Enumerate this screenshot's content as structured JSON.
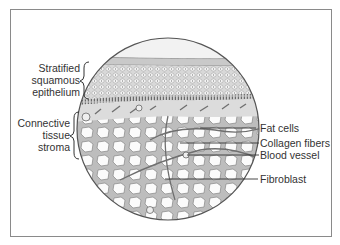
{
  "diagram": {
    "type": "histology-illustration",
    "left_labels": [
      {
        "lines": [
          "Stratified",
          "squamous",
          "epithelium"
        ]
      },
      {
        "lines": [
          "Connective",
          "tissue",
          "stroma"
        ]
      }
    ],
    "right_labels": [
      {
        "text": "Fat cells"
      },
      {
        "text": "Collagen fibers"
      },
      {
        "text": "Blood vessel"
      },
      {
        "text": "Fibroblast"
      }
    ],
    "colors": {
      "frame": "#8a8a8a",
      "outline": "#555555",
      "text": "#333333",
      "tissue_fill": "#e9e9e9",
      "cell_fill": "#fbfbfb"
    }
  }
}
